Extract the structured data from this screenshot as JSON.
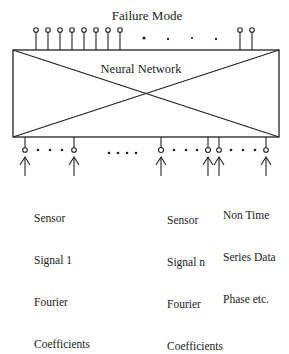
{
  "diagram": {
    "title": "Failure Mode",
    "box_label": "Neural Network",
    "outputs": {
      "pins_x_left": [
        36,
        48,
        60,
        72,
        84,
        96,
        108,
        120
      ],
      "dots_x": [
        144,
        168,
        192,
        216
      ],
      "pins_x_right": [
        240,
        252
      ]
    },
    "inputs": {
      "groups": [
        {
          "label_lines": [
            "Sensor",
            "Signal 1",
            "Fourier",
            "Coefficients"
          ],
          "pins_x": [
            25,
            74
          ],
          "dots_x": [
            37,
            49,
            61
          ]
        },
        {
          "label_lines": [
            "Sensor",
            "Signal n",
            "Fourier",
            "Coefficients"
          ],
          "pins_x": [
            161,
            208
          ],
          "dots_x": [
            173,
            185,
            197
          ]
        },
        {
          "label_lines": [
            "Non Time",
            "Series Data",
            "Phase etc."
          ],
          "pins_x": [
            219,
            266
          ],
          "dots_x": [
            231,
            243,
            255
          ]
        }
      ],
      "middle_dots_x": [
        108,
        117,
        126,
        135
      ]
    },
    "colors": {
      "stroke": "#222222",
      "background": "#ffffff"
    }
  }
}
